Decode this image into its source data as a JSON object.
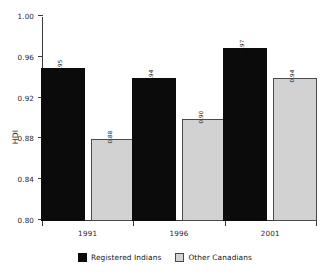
{
  "chart_data": {
    "type": "bar",
    "title": "",
    "subtitle": "",
    "xlabel": "",
    "ylabel": "HDI",
    "categories": [
      "1991",
      "1996",
      "2001"
    ],
    "series": [
      {
        "name": "Registered Indians",
        "color": "#0b0b0b",
        "values": [
          0.95,
          0.94,
          0.97
        ]
      },
      {
        "name": "Other Canadians",
        "color": "#d2d2d2",
        "values": [
          0.88,
          0.9,
          0.94
        ]
      }
    ],
    "value_labels": [
      [
        "0.95",
        "0.94",
        "0.97"
      ],
      [
        "0.88",
        "0.90",
        "0.94"
      ]
    ],
    "ylim": [
      0.8,
      1.0
    ],
    "yticks": [
      0.8,
      0.84,
      0.88,
      0.92,
      0.96,
      1.0
    ],
    "ytick_labels": [
      "0.80",
      "0.84",
      "0.88",
      "0.92",
      "0.96",
      "1.00"
    ],
    "grid": false,
    "legend_position": "bottom",
    "bar_orientation": "vertical",
    "value_label_rotation": "vertical"
  },
  "legend": {
    "items": [
      {
        "label": "Registered Indians"
      },
      {
        "label": "Other Canadians"
      }
    ]
  }
}
